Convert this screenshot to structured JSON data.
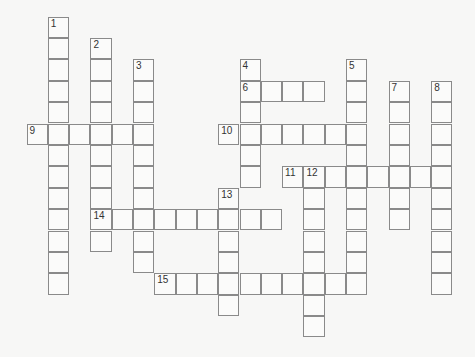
{
  "puzzle": {
    "type": "crossword",
    "origin": {
      "x": 27,
      "y": 17
    },
    "cell_size": {
      "w": 21.3,
      "h": 21.4
    },
    "entries": [
      {
        "number": "1",
        "direction": "down",
        "row": 0,
        "col": 1,
        "length": 13
      },
      {
        "number": "2",
        "direction": "down",
        "row": 1,
        "col": 3,
        "length": 10
      },
      {
        "number": "3",
        "direction": "down",
        "row": 2,
        "col": 5,
        "length": 10
      },
      {
        "number": "4",
        "direction": "down",
        "row": 2,
        "col": 10,
        "length": 6
      },
      {
        "number": "5",
        "direction": "down",
        "row": 2,
        "col": 15,
        "length": 11
      },
      {
        "number": "6",
        "direction": "across",
        "row": 3,
        "col": 10,
        "length": 4
      },
      {
        "number": "7",
        "direction": "down",
        "row": 3,
        "col": 17,
        "length": 7
      },
      {
        "number": "8",
        "direction": "down",
        "row": 3,
        "col": 19,
        "length": 10
      },
      {
        "number": "9",
        "direction": "across",
        "row": 5,
        "col": 0,
        "length": 6
      },
      {
        "number": "10",
        "direction": "across",
        "row": 5,
        "col": 9,
        "length": 7
      },
      {
        "number": "11",
        "direction": "across",
        "row": 7,
        "col": 12,
        "length": 8
      },
      {
        "number": "12",
        "direction": "down",
        "row": 7,
        "col": 13,
        "length": 8
      },
      {
        "number": "13",
        "direction": "down",
        "row": 8,
        "col": 9,
        "length": 6
      },
      {
        "number": "14",
        "direction": "across",
        "row": 9,
        "col": 3,
        "length": 9
      },
      {
        "number": "15",
        "direction": "across",
        "row": 12,
        "col": 6,
        "length": 10
      }
    ]
  }
}
